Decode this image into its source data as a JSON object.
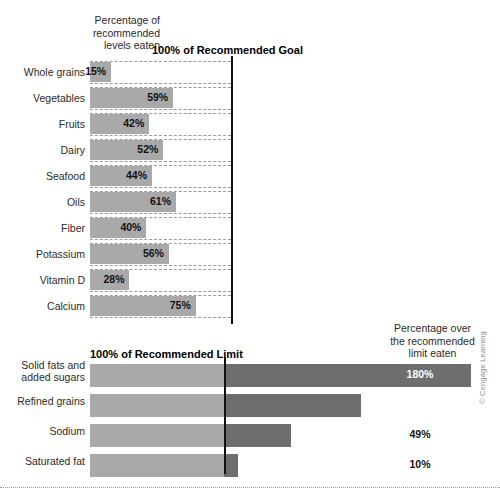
{
  "chart_data": {
    "type": "bar",
    "title": "",
    "orientation": "horizontal",
    "panels": [
      {
        "id": "under-consumed",
        "caption": "Percentage of\nrecommended\nlevels eaten",
        "axis_title": "100% of Recommended Goal",
        "axis_title_value": 100,
        "xlim": [
          0,
          100
        ],
        "grid": "dashed-horizontal",
        "bar_color": "#a9a9a9",
        "categories": [
          "Whole grains",
          "Vegetables",
          "Fruits",
          "Dairy",
          "Seafood",
          "Oils",
          "Fiber",
          "Potassium",
          "Vitamin D",
          "Calcium"
        ],
        "values": [
          15,
          59,
          42,
          52,
          44,
          61,
          40,
          56,
          28,
          75
        ],
        "value_labels": [
          "15%",
          "59%",
          "42%",
          "52%",
          "44%",
          "61%",
          "40%",
          "56%",
          "28%",
          "75%"
        ]
      },
      {
        "id": "over-consumed",
        "caption": "Percentage over\nthe recommended\nlimit eaten",
        "axis_title": "100% of Recommended Limit",
        "axis_title_value": 100,
        "xlim": [
          0,
          200
        ],
        "grid": "none",
        "base_color": "#a9a9a9",
        "over_color": "#6e6e6e",
        "categories": [
          "Solid fats and added sugars",
          "Refined grains",
          "Sodium",
          "Saturated fat"
        ],
        "values": [
          180,
          100,
          49,
          10
        ],
        "value_labels": [
          "180%",
          "100%",
          "49%",
          "10%"
        ]
      }
    ]
  },
  "top_panel": {
    "caption_line1": "Percentage of",
    "caption_line2": "recommended",
    "caption_line3": "levels eaten",
    "axis_title": "100% of Recommended Goal",
    "rows": [
      {
        "label": "Whole grains",
        "value": "15%"
      },
      {
        "label": "Vegetables",
        "value": "59%"
      },
      {
        "label": "Fruits",
        "value": "42%"
      },
      {
        "label": "Dairy",
        "value": "52%"
      },
      {
        "label": "Seafood",
        "value": "44%"
      },
      {
        "label": "Oils",
        "value": "61%"
      },
      {
        "label": "Fiber",
        "value": "40%"
      },
      {
        "label": "Potassium",
        "value": "56%"
      },
      {
        "label": "Vitamin D",
        "value": "28%"
      },
      {
        "label": "Calcium",
        "value": "75%"
      }
    ]
  },
  "bottom_panel": {
    "caption_line1": "Percentage over",
    "caption_line2": "the recommended",
    "caption_line3": "limit eaten",
    "axis_title": "100% of Recommended Limit",
    "rows": [
      {
        "label_line1": "Solid fats and",
        "label_line2": "added sugars",
        "value": "180%"
      },
      {
        "label_line1": "Refined grains",
        "label_line2": "",
        "value": "100%"
      },
      {
        "label_line1": "Sodium",
        "label_line2": "",
        "value": "49%"
      },
      {
        "label_line1": "Saturated fat",
        "label_line2": "",
        "value": "10%"
      }
    ]
  },
  "credit": "© Cengage Learning",
  "colors": {
    "bar_light": "#a9a9a9",
    "bar_dark": "#6e6e6e",
    "axis_line": "#111111",
    "grid_dash": "#9b9b9b",
    "text": "#2b2b2b"
  }
}
